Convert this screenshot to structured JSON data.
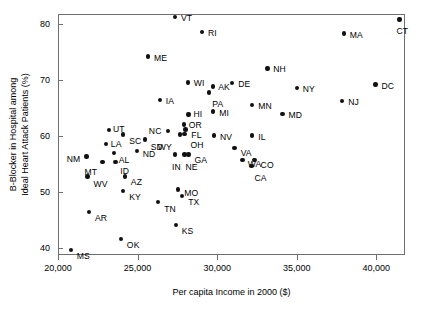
{
  "chart_data": {
    "type": "scatter",
    "title": "",
    "xlabel": "Per capita Income in 2000 ($)",
    "ylabel_line1": "B-Blocker in Hospital among",
    "ylabel_line2": "Ideal Heart Attack Patients (%)",
    "xlim": [
      20000,
      41800
    ],
    "ylim": [
      38.8,
      81.8
    ],
    "xticks": [
      20000,
      25000,
      30000,
      35000,
      40000
    ],
    "xtick_labels": [
      "20,000",
      "25,000",
      "30,000",
      "35,000",
      "40,000"
    ],
    "yticks": [
      40,
      50,
      60,
      70,
      80
    ],
    "ytick_labels": [
      "40",
      "50",
      "60",
      "70",
      "80"
    ],
    "grid": false,
    "legend": "none",
    "marker_color": "#111111",
    "frame_color": "#6f6f6f",
    "points": [
      {
        "label": "VT",
        "x": 27350,
        "y": 81.3,
        "lx": 6,
        "ly": -3
      },
      {
        "label": "RI",
        "x": 29050,
        "y": 78.6,
        "lx": 6,
        "ly": -3
      },
      {
        "label": "MA",
        "x": 37950,
        "y": 78.3,
        "lx": 6,
        "ly": -3
      },
      {
        "label": "CT",
        "x": 41450,
        "y": 80.8,
        "lx": -3,
        "ly": 7
      },
      {
        "label": "ME",
        "x": 25650,
        "y": 74.2,
        "lx": 6,
        "ly": -3
      },
      {
        "label": "NH",
        "x": 33150,
        "y": 72.1,
        "lx": 6,
        "ly": -3
      },
      {
        "label": "WI",
        "x": 28150,
        "y": 69.6,
        "lx": 6,
        "ly": -3
      },
      {
        "label": "DE",
        "x": 30950,
        "y": 69.5,
        "lx": 6,
        "ly": -3
      },
      {
        "label": "AK",
        "x": 29750,
        "y": 68.9,
        "lx": 5,
        "ly": -3
      },
      {
        "label": "PA",
        "x": 29500,
        "y": 67.8,
        "lx": 3,
        "ly": 8
      },
      {
        "label": "NY",
        "x": 35000,
        "y": 68.6,
        "lx": 6,
        "ly": -3
      },
      {
        "label": "DC",
        "x": 39950,
        "y": 69.2,
        "lx": 6,
        "ly": -3
      },
      {
        "label": "IA",
        "x": 26400,
        "y": 66.5,
        "lx": 6,
        "ly": -3
      },
      {
        "label": "NJ",
        "x": 37850,
        "y": 66.3,
        "lx": 6,
        "ly": -3
      },
      {
        "label": "MN",
        "x": 32200,
        "y": 65.6,
        "lx": 6,
        "ly": -3
      },
      {
        "label": "MI",
        "x": 29750,
        "y": 64.4,
        "lx": 6,
        "ly": -3
      },
      {
        "label": "MD",
        "x": 34100,
        "y": 64.0,
        "lx": 6,
        "ly": -3
      },
      {
        "label": "HI",
        "x": 28200,
        "y": 63.9,
        "lx": 5,
        "ly": -4
      },
      {
        "label": "OR",
        "x": 27900,
        "y": 62.1,
        "lx": 5,
        "ly": -3
      },
      {
        "label": "NC",
        "x": 26900,
        "y": 60.9,
        "lx": -19,
        "ly": -4
      },
      {
        "label": "UT",
        "x": 23200,
        "y": 61.1,
        "lx": 4,
        "ly": -5
      },
      {
        "label": "FL",
        "x": 28000,
        "y": 61.2,
        "lx": 6,
        "ly": 2
      },
      {
        "label": "OH",
        "x": 27950,
        "y": 60.4,
        "lx": 6,
        "ly": 7
      },
      {
        "label": "WY",
        "x": 27650,
        "y": 60.3,
        "lx": -22,
        "ly": 8
      },
      {
        "label": "SC",
        "x": 24100,
        "y": 60.3,
        "lx": 6,
        "ly": 2
      },
      {
        "label": "NV",
        "x": 29800,
        "y": 60.1,
        "lx": 6,
        "ly": -3
      },
      {
        "label": "IL",
        "x": 32200,
        "y": 60.1,
        "lx": 6,
        "ly": -3
      },
      {
        "label": "SD",
        "x": 25450,
        "y": 59.4,
        "lx": 6,
        "ly": 3
      },
      {
        "label": "LA",
        "x": 23000,
        "y": 58.6,
        "lx": 5,
        "ly": -4
      },
      {
        "label": "VA",
        "x": 31100,
        "y": 57.9,
        "lx": 6,
        "ly": 1
      },
      {
        "label": "ND",
        "x": 24950,
        "y": 57.4,
        "lx": 6,
        "ly": -1
      },
      {
        "label": "AL",
        "x": 23500,
        "y": 57.0,
        "lx": 5,
        "ly": 3
      },
      {
        "label": "NM",
        "x": 21800,
        "y": 56.4,
        "lx": -20,
        "ly": -1
      },
      {
        "label": "GA",
        "x": 28200,
        "y": 56.7,
        "lx": 6,
        "ly": 1
      },
      {
        "label": "NE",
        "x": 27950,
        "y": 56.7,
        "lx": 1,
        "ly": 8
      },
      {
        "label": "IN",
        "x": 27350,
        "y": 56.7,
        "lx": -3,
        "ly": 8
      },
      {
        "label": "CO",
        "x": 32350,
        "y": 55.8,
        "lx": 6,
        "ly": 1
      },
      {
        "label": "WA",
        "x": 31600,
        "y": 55.7,
        "lx": 5,
        "ly": 0
      },
      {
        "label": "MT",
        "x": 22800,
        "y": 55.4,
        "lx": -18,
        "ly": 6
      },
      {
        "label": "ID",
        "x": 23600,
        "y": 55.4,
        "lx": 5,
        "ly": 5
      },
      {
        "label": "CA",
        "x": 32150,
        "y": 54.7,
        "lx": 3,
        "ly": 8
      },
      {
        "label": "WV",
        "x": 21850,
        "y": 52.8,
        "lx": 6,
        "ly": 3
      },
      {
        "label": "AZ",
        "x": 24200,
        "y": 52.8,
        "lx": 6,
        "ly": 1
      },
      {
        "label": "MO",
        "x": 27550,
        "y": 50.5,
        "lx": 6,
        "ly": 0
      },
      {
        "label": "KY",
        "x": 24100,
        "y": 50.2,
        "lx": 6,
        "ly": 2
      },
      {
        "label": "TX",
        "x": 27800,
        "y": 49.3,
        "lx": 6,
        "ly": 2
      },
      {
        "label": "TN",
        "x": 26300,
        "y": 48.3,
        "lx": 6,
        "ly": 3
      },
      {
        "label": "AR",
        "x": 21950,
        "y": 46.5,
        "lx": 6,
        "ly": 2
      },
      {
        "label": "KS",
        "x": 27400,
        "y": 44.2,
        "lx": 6,
        "ly": 2
      },
      {
        "label": "OK",
        "x": 23950,
        "y": 41.7,
        "lx": 6,
        "ly": 2
      },
      {
        "label": "MS",
        "x": 20800,
        "y": 39.7,
        "lx": 6,
        "ly": 2
      }
    ]
  }
}
